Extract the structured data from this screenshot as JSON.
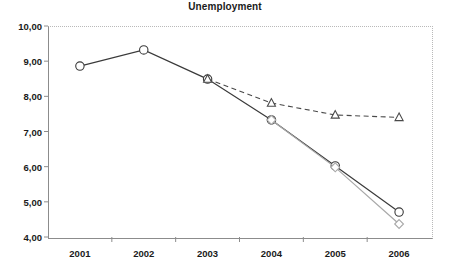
{
  "chart_data": {
    "type": "line",
    "title": "Unemployment",
    "xlabel": "",
    "ylabel": "",
    "categories": [
      "2001",
      "2002",
      "2003",
      "2004",
      "2005",
      "2006"
    ],
    "ylim": [
      4.0,
      10.0
    ],
    "ytick_labels": [
      "4,00",
      "5,00",
      "6,00",
      "7,00",
      "8,00",
      "9,00",
      "10,00"
    ],
    "ytick_values": [
      4.0,
      5.0,
      6.0,
      7.0,
      8.0,
      9.0,
      10.0
    ],
    "grid": false,
    "legend_position": "none",
    "decimal_separator": ",",
    "series": [
      {
        "name": "actual",
        "marker": "circle",
        "line_style": "solid",
        "color": "#3a3a3a",
        "values": [
          8.86,
          9.32,
          8.49,
          7.33,
          6.02,
          4.71
        ]
      },
      {
        "name": "forecast-dashed",
        "marker": "triangle",
        "line_style": "dashed",
        "color": "#4a4a4a",
        "values": [
          null,
          null,
          8.49,
          7.81,
          7.47,
          7.4
        ]
      },
      {
        "name": "alternate",
        "marker": "diamond",
        "line_style": "solid",
        "color": "#a8a8a8",
        "values": [
          null,
          null,
          null,
          7.33,
          5.98,
          4.37
        ]
      }
    ]
  },
  "axis": {
    "frame_color": "#8c8c8c",
    "dotted_border_color": "#b9b9b9",
    "tick_color": "#8c8c8c"
  }
}
